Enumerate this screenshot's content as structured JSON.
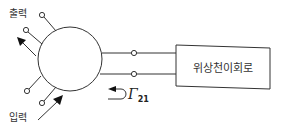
{
  "diagram": {
    "labels": {
      "output": "출력",
      "input": "입력",
      "box": "위상천이회로",
      "gamma_symbol": "Γ",
      "gamma_subscript": "21"
    },
    "colors": {
      "stroke": "#333333",
      "background": "#ffffff"
    }
  }
}
